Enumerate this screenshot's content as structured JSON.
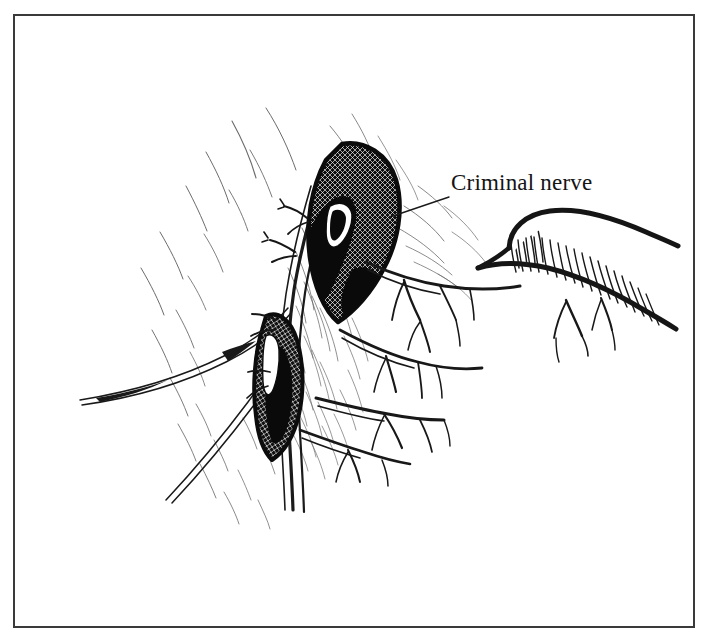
{
  "figure": {
    "kind": "anatomical-line-drawing",
    "medium": "pen-and-ink",
    "title": "Criminal nerve",
    "background_color": "#ffffff",
    "ink_color": "#161616",
    "hatch_color": "#4a4a4a",
    "width": 709,
    "height": 642
  },
  "frame": {
    "name": "plate-border",
    "color": "#3a3a3a",
    "left": 14,
    "top": 15,
    "right": 694,
    "bottom": 627,
    "stroke_width": 2
  },
  "annotations": [
    {
      "id": "criminal-nerve",
      "label": "Criminal nerve",
      "font_size_px": 23,
      "text_x": 451,
      "text_y": 170,
      "leader": {
        "from_x": 449,
        "from_y": 196,
        "to_x": 390,
        "to_y": 216
      }
    }
  ],
  "structures": [
    {
      "id": "upper-cross-hatched-mass",
      "name": "Upper hatched vessel stump",
      "fill": "cross-hatch",
      "shade": "#101010"
    },
    {
      "id": "lower-cross-hatched-mass",
      "name": "Lower hatched vessel stump",
      "fill": "cross-hatch",
      "shade": "#121212"
    },
    {
      "id": "esophagus-hook",
      "name": "Retracted hooked tubular structure",
      "fill": "line-hatch",
      "shade": "#1a1a1a"
    },
    {
      "id": "main-nerve-trunk",
      "name": "Main nerve trunk descending",
      "fill": "outline",
      "shade": "#161616"
    },
    {
      "id": "nerve-branches",
      "name": "Branching nerve fibers",
      "fill": "outline",
      "shade": "#161616"
    },
    {
      "id": "tissue-shading",
      "name": "Radiating tissue hatching",
      "fill": "fine-hatch",
      "shade": "#5a5a5a"
    }
  ]
}
